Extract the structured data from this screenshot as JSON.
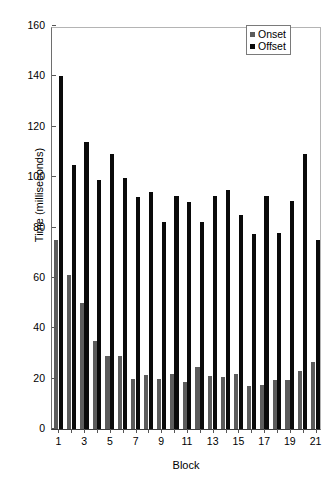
{
  "chart_data": {
    "type": "bar",
    "title": "",
    "xlabel": "Block",
    "ylabel": "Time (milliseconds)",
    "ylim": [
      0,
      160
    ],
    "yticks": [
      0,
      20,
      40,
      60,
      80,
      100,
      120,
      140,
      160
    ],
    "xticks": [
      1,
      3,
      5,
      7,
      9,
      11,
      13,
      15,
      17,
      19,
      21
    ],
    "grid": false,
    "legend_position": "top-right",
    "categories": [
      1,
      2,
      3,
      4,
      5,
      6,
      7,
      8,
      9,
      10,
      11,
      12,
      13,
      14,
      15,
      16,
      17,
      18,
      19,
      20,
      21
    ],
    "series": [
      {
        "name": "Onset",
        "color": "#5c5c5c",
        "values": [
          75,
          61,
          50,
          35,
          29,
          29,
          20,
          21.5,
          20,
          22,
          18.5,
          24.5,
          21,
          20.5,
          22,
          17,
          17.5,
          19.5,
          19.5,
          23,
          26.5
        ]
      },
      {
        "name": "Offset",
        "color": "#0a0a0a",
        "values": [
          140,
          105,
          114,
          99,
          109,
          99.5,
          92,
          94,
          82,
          92.5,
          90,
          82,
          92.5,
          95,
          85,
          77.5,
          92.5,
          78,
          90.5,
          109,
          75
        ]
      }
    ]
  },
  "legend": {
    "items": [
      {
        "label": "Onset"
      },
      {
        "label": "Offset"
      }
    ]
  },
  "axes": {
    "y_title": "Time (milliseconds)",
    "x_title": "Block"
  }
}
